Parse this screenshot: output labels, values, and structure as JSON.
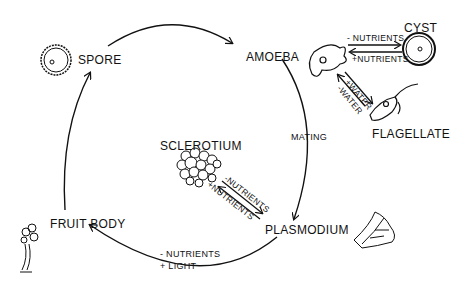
{
  "diagram": {
    "type": "life-cycle",
    "stages": {
      "spore": "SPORE",
      "amoeba": "AMOEBA",
      "cyst": "CYST",
      "flagellate": "FLAGELLATE",
      "plasmodium": "PLASMODIUM",
      "sclerotium": "SCLEROTIUM",
      "fruit_body": "FRUIT BODY"
    },
    "transitions": {
      "amoeba_to_cyst": "- NUTRIENTS",
      "cyst_to_amoeba": "+NUTRIENTS",
      "amoeba_to_flagellate": "+WATER",
      "flagellate_to_amoeba": "-WATER",
      "amoeba_to_plasmodium": "MATING",
      "plasmodium_to_sclerotium": "-NUTRIENTS",
      "sclerotium_to_plasmodium": "+NUTRIENTS",
      "plasmodium_to_fruit_body_1": "- NUTRIENTS",
      "plasmodium_to_fruit_body_2": "+ LIGHT"
    },
    "colors": {
      "ink": "#111111",
      "background": "#ffffff"
    }
  }
}
